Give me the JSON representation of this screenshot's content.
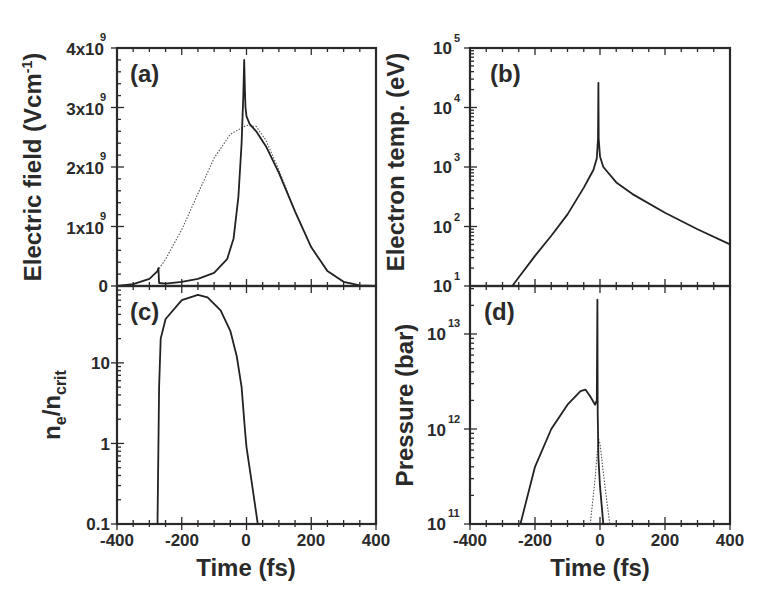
{
  "chart_data": [
    {
      "panel": "(a)",
      "type": "line",
      "xlabel": "",
      "ylabel": "Electric field (Vcm-1)",
      "xlim": [
        -400,
        400
      ],
      "ylim": [
        0,
        4000000000.0
      ],
      "yscale": "linear",
      "yticks": [
        "0",
        "1x10^9",
        "2x10^9",
        "3x10^9",
        "4x10^9"
      ],
      "series": [
        {
          "name": "transmitted field (solid)",
          "style": "solid",
          "x": [
            -400,
            -350,
            -300,
            -275,
            -272,
            -270,
            -250,
            -200,
            -150,
            -100,
            -60,
            -40,
            -25,
            -15,
            -10,
            -7,
            -5,
            -3,
            0,
            10,
            30,
            60,
            100,
            150,
            200,
            250,
            300,
            350,
            400
          ],
          "y": [
            0,
            30000000.0,
            120000000.0,
            250000000.0,
            300000000.0,
            50000000.0,
            40000000.0,
            70000000.0,
            120000000.0,
            220000000.0,
            450000000.0,
            800000000.0,
            1500000000.0,
            2400000000.0,
            3200000000.0,
            3800000000.0,
            3300000000.0,
            3000000000.0,
            2850000000.0,
            2720000000.0,
            2600000000.0,
            2350000000.0,
            1900000000.0,
            1250000000.0,
            650000000.0,
            250000000.0,
            70000000.0,
            10000000.0,
            0
          ]
        },
        {
          "name": "incident field (dotted)",
          "style": "dotted",
          "x": [
            -275,
            -250,
            -200,
            -150,
            -100,
            -50,
            0,
            30,
            60,
            100,
            150,
            200,
            250,
            300,
            350,
            400
          ],
          "y": [
            250000000.0,
            450000000.0,
            950000000.0,
            1550000000.0,
            2150000000.0,
            2550000000.0,
            2700000000.0,
            2680000000.0,
            2450000000.0,
            1950000000.0,
            1250000000.0,
            650000000.0,
            250000000.0,
            70000000.0,
            10000000.0,
            0
          ]
        }
      ]
    },
    {
      "panel": "(b)",
      "type": "line",
      "xlabel": "",
      "ylabel": "Electron temp. (eV)",
      "xlim": [
        -400,
        400
      ],
      "ylim": [
        10,
        100000
      ],
      "yscale": "log",
      "yticks": [
        "10^1",
        "10^2",
        "10^3",
        "10^4",
        "10^5"
      ],
      "series": [
        {
          "name": "electron temperature",
          "style": "solid",
          "x": [
            -270,
            -250,
            -200,
            -150,
            -100,
            -50,
            -20,
            -10,
            -6,
            -5,
            -4,
            0,
            10,
            50,
            100,
            200,
            300,
            400
          ],
          "y": [
            10,
            14,
            32,
            70,
            160,
            450,
            900,
            1400,
            3000,
            26000,
            3000,
            1500,
            1000,
            550,
            350,
            170,
            90,
            50
          ]
        }
      ]
    },
    {
      "panel": "(c)",
      "type": "line",
      "xlabel": "Time (fs)",
      "ylabel": "n_e/n_crit",
      "xlim": [
        -400,
        400
      ],
      "ylim": [
        0.1,
        90
      ],
      "yscale": "log",
      "yticks": [
        "0.1",
        "1",
        "10"
      ],
      "xticks": [
        "-400",
        "-200",
        "0",
        "200",
        "400"
      ],
      "series": [
        {
          "name": "electron density ratio",
          "style": "solid",
          "x": [
            -275,
            -270,
            -265,
            -250,
            -200,
            -150,
            -120,
            -80,
            -50,
            -30,
            -15,
            -5,
            0,
            15,
            35
          ],
          "y": [
            0.1,
            5,
            20,
            35,
            60,
            70,
            65,
            45,
            25,
            12,
            5,
            1.5,
            0.9,
            0.35,
            0.1
          ]
        }
      ]
    },
    {
      "panel": "(d)",
      "type": "line",
      "xlabel": "Time (fs)",
      "ylabel": "Pressure (bar)",
      "xlim": [
        -400,
        400
      ],
      "ylim": [
        100000000000.0,
        32000000000000.0
      ],
      "yscale": "log",
      "yticks": [
        "10^11",
        "10^12",
        "10^13"
      ],
      "xticks": [
        "-400",
        "-200",
        "0",
        "200",
        "400"
      ],
      "series": [
        {
          "name": "pressure (solid)",
          "style": "solid",
          "x": [
            -245,
            -200,
            -150,
            -100,
            -60,
            -45,
            -30,
            -15,
            -10,
            -8,
            -7,
            -5,
            0,
            10
          ],
          "y": [
            100000000000.0,
            400000000000.0,
            1000000000000.0,
            1800000000000.0,
            2500000000000.0,
            2600000000000.0,
            2200000000000.0,
            1800000000000.0,
            2000000000000.0,
            23000000000000.0,
            1500000000000.0,
            500000000000.0,
            250000000000.0,
            100000000000.0
          ]
        },
        {
          "name": "pressure (dotted)",
          "style": "dotted",
          "x": [
            -30,
            -15,
            -5,
            0,
            15,
            30
          ],
          "y": [
            100000000000.0,
            300000000000.0,
            800000000000.0,
            700000000000.0,
            250000000000.0,
            100000000000.0
          ]
        }
      ]
    }
  ],
  "labels": {
    "panel_a": "(a)",
    "panel_b": "(b)",
    "panel_c": "(c)",
    "panel_d": "(d)",
    "ylabel_a": "Electric field (Vcm",
    "ylabel_a_sup": "-1",
    "ylabel_a_close": ")",
    "ylabel_b": "Electron temp. (eV)",
    "ylabel_c_n1": "n",
    "ylabel_c_sub1": "e",
    "ylabel_c_slash": "/n",
    "ylabel_c_sub2": "crit",
    "ylabel_d": "Pressure (bar)",
    "xlabel": "Time (fs)",
    "yticks_a": [
      {
        "base": "4x10",
        "exp": "9"
      },
      {
        "base": "3x10",
        "exp": "9"
      },
      {
        "base": "2x10",
        "exp": "9"
      },
      {
        "base": "1x10",
        "exp": "9"
      },
      {
        "base": "0",
        "exp": ""
      }
    ],
    "yticks_b": [
      {
        "base": "10",
        "exp": "5"
      },
      {
        "base": "10",
        "exp": "4"
      },
      {
        "base": "10",
        "exp": "3"
      },
      {
        "base": "10",
        "exp": "2"
      },
      {
        "base": "10",
        "exp": "1"
      }
    ],
    "yticks_c": [
      "10",
      "1",
      "0.1"
    ],
    "yticks_d": [
      {
        "base": "10",
        "exp": "13"
      },
      {
        "base": "10",
        "exp": "12"
      },
      {
        "base": "10",
        "exp": "11"
      }
    ],
    "xticks": [
      "-400",
      "-200",
      "0",
      "200",
      "400"
    ]
  }
}
